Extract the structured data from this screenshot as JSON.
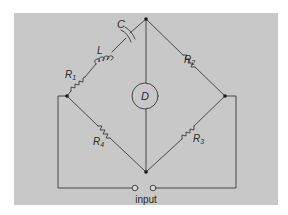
{
  "diagram": {
    "colors": {
      "background": "#ffffff",
      "panel": "#c8c8c8",
      "wire": "#3a3a3a",
      "node": "#1a1a1a",
      "text": "#2a2a2a"
    },
    "components": {
      "capacitor": {
        "label": "C"
      },
      "inductor": {
        "label": "L"
      },
      "r1": {
        "label": "R",
        "sub": "1"
      },
      "r2": {
        "label": "R",
        "sub": "2"
      },
      "r3": {
        "label": "R",
        "sub": "3"
      },
      "r4": {
        "label": "R",
        "sub": "4"
      },
      "detector": {
        "label": "D"
      }
    },
    "terminals": {
      "label": "input"
    }
  }
}
